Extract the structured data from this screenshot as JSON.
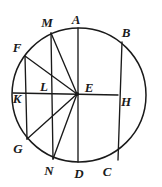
{
  "figure": {
    "kind": "circle-with-chords-and-radii",
    "stroke_color": "#1a1a1a",
    "background_color": "#ffffff",
    "circle": {
      "center_label": "E",
      "cx": 79,
      "cy": 95,
      "r": 67
    },
    "labels": [
      {
        "name": "label-M",
        "text": "M",
        "x": 47,
        "y": 22
      },
      {
        "name": "label-A",
        "text": "A",
        "x": 76,
        "y": 19
      },
      {
        "name": "label-B",
        "text": "B",
        "x": 126,
        "y": 32
      },
      {
        "name": "label-F",
        "text": "F",
        "x": 17,
        "y": 47
      },
      {
        "name": "label-L",
        "text": "L",
        "x": 44,
        "y": 86
      },
      {
        "name": "label-E",
        "text": "E",
        "x": 89,
        "y": 87
      },
      {
        "name": "label-K",
        "text": "K",
        "x": 17,
        "y": 98
      },
      {
        "name": "label-H",
        "text": "H",
        "x": 126,
        "y": 101
      },
      {
        "name": "label-G",
        "text": "G",
        "x": 18,
        "y": 148
      },
      {
        "name": "label-N",
        "text": "N",
        "x": 49,
        "y": 170
      },
      {
        "name": "label-D",
        "text": "D",
        "x": 79,
        "y": 173
      },
      {
        "name": "label-C",
        "text": "C",
        "x": 107,
        "y": 171
      }
    ],
    "segments": [
      {
        "name": "segment-A-D",
        "x1": 78,
        "y1": 28,
        "x2": 78,
        "y2": 162
      },
      {
        "name": "segment-M-N",
        "x1": 51,
        "y1": 33,
        "x2": 53,
        "y2": 159
      },
      {
        "name": "segment-F-G",
        "x1": 25,
        "y1": 56,
        "x2": 27,
        "y2": 139
      },
      {
        "name": "segment-B-C",
        "x1": 122,
        "y1": 42,
        "x2": 118,
        "y2": 160
      },
      {
        "name": "segment-K-H",
        "x1": 13,
        "y1": 93,
        "x2": 118,
        "y2": 95
      },
      {
        "name": "segment-E-M",
        "x1": 77,
        "y1": 94,
        "x2": 51,
        "y2": 33
      },
      {
        "name": "segment-E-F",
        "x1": 77,
        "y1": 94,
        "x2": 25,
        "y2": 56
      },
      {
        "name": "segment-E-G",
        "x1": 77,
        "y1": 94,
        "x2": 27,
        "y2": 139
      },
      {
        "name": "segment-E-N",
        "x1": 77,
        "y1": 94,
        "x2": 53,
        "y2": 159
      }
    ]
  }
}
